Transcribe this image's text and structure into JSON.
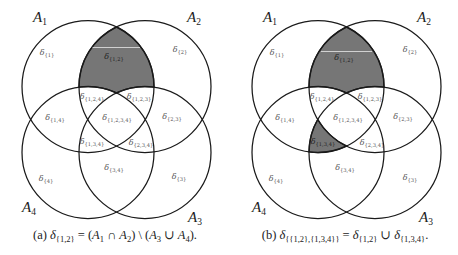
{
  "figure": {
    "colors": {
      "shade": "#767676",
      "stroke": "#1a1a1a",
      "background": "#ffffff"
    },
    "panels": [
      {
        "id": "a",
        "set_labels": [
          {
            "name": "A",
            "index": "1"
          },
          {
            "name": "A",
            "index": "2"
          },
          {
            "name": "A",
            "index": "3"
          },
          {
            "name": "A",
            "index": "4"
          }
        ],
        "regions": [
          {
            "symbol": "δ",
            "subscript": "{1}",
            "shaded": false
          },
          {
            "symbol": "δ",
            "subscript": "{2}",
            "shaded": false
          },
          {
            "symbol": "δ",
            "subscript": "{1,2}",
            "shaded": true
          },
          {
            "symbol": "δ",
            "subscript": "{1,2,4}",
            "shaded": false
          },
          {
            "symbol": "δ",
            "subscript": "{1,2,3}",
            "shaded": false
          },
          {
            "symbol": "δ",
            "subscript": "{1,4}",
            "shaded": false
          },
          {
            "symbol": "δ",
            "subscript": "{1,2,3,4}",
            "shaded": false
          },
          {
            "symbol": "δ",
            "subscript": "{2,3}",
            "shaded": false
          },
          {
            "symbol": "δ",
            "subscript": "{1,3,4}",
            "shaded": false
          },
          {
            "symbol": "δ",
            "subscript": "{2,3,4}",
            "shaded": false
          },
          {
            "symbol": "δ",
            "subscript": "{3,4}",
            "shaded": false
          },
          {
            "symbol": "δ",
            "subscript": "{4}",
            "shaded": false
          },
          {
            "symbol": "δ",
            "subscript": "{3}",
            "shaded": false
          }
        ],
        "caption": {
          "segments": [
            {
              "text": "(a) "
            },
            {
              "text": "δ"
            },
            {
              "text": "{1,2}"
            },
            {
              "text": " = ("
            },
            {
              "text": "A"
            },
            {
              "text": "1"
            },
            {
              "text": " ∩ "
            },
            {
              "text": "A"
            },
            {
              "text": "2"
            },
            {
              "text": ") \\ ("
            },
            {
              "text": "A"
            },
            {
              "text": "3"
            },
            {
              "text": " ∪ "
            },
            {
              "text": "A"
            },
            {
              "text": "4"
            },
            {
              "text": ")."
            }
          ]
        }
      },
      {
        "id": "b",
        "set_labels": [
          {
            "name": "A",
            "index": "1"
          },
          {
            "name": "A",
            "index": "2"
          },
          {
            "name": "A",
            "index": "3"
          },
          {
            "name": "A",
            "index": "4"
          }
        ],
        "regions": [
          {
            "symbol": "δ",
            "subscript": "{1}",
            "shaded": false
          },
          {
            "symbol": "δ",
            "subscript": "{2}",
            "shaded": false
          },
          {
            "symbol": "δ",
            "subscript": "{1,2}",
            "shaded": true
          },
          {
            "symbol": "δ",
            "subscript": "{1,2,4}",
            "shaded": false
          },
          {
            "symbol": "δ",
            "subscript": "{1,2,3}",
            "shaded": false
          },
          {
            "symbol": "δ",
            "subscript": "{1,4}",
            "shaded": false
          },
          {
            "symbol": "δ",
            "subscript": "{1,2,3,4}",
            "shaded": false
          },
          {
            "symbol": "δ",
            "subscript": "{2,3}",
            "shaded": false
          },
          {
            "symbol": "δ",
            "subscript": "{1,3,4}",
            "shaded": true
          },
          {
            "symbol": "δ",
            "subscript": "{2,3,4}",
            "shaded": false
          },
          {
            "symbol": "δ",
            "subscript": "{3,4}",
            "shaded": false
          },
          {
            "symbol": "δ",
            "subscript": "{4}",
            "shaded": false
          },
          {
            "symbol": "δ",
            "subscript": "{3}",
            "shaded": false
          }
        ],
        "caption": {
          "segments": [
            {
              "text": "(b) "
            },
            {
              "text": "δ"
            },
            {
              "text": "{{1,2},{1,3,4}}"
            },
            {
              "text": " = "
            },
            {
              "text": "δ"
            },
            {
              "text": "{1,2}"
            },
            {
              "text": " ∪ "
            },
            {
              "text": "δ"
            },
            {
              "text": "{1,3,4}"
            },
            {
              "text": "."
            }
          ]
        }
      }
    ]
  }
}
